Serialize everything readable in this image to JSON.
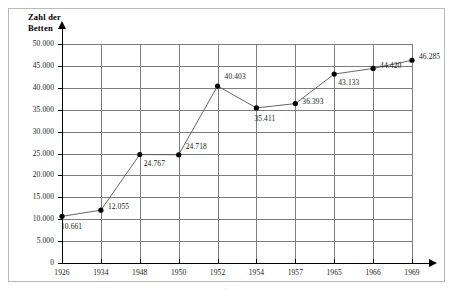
{
  "chart_data": {
    "type": "line",
    "title": "",
    "ylabel": "Zahl der\nBetten",
    "ylabel_line1": "Zahl der",
    "ylabel_line2": "Betten",
    "xlabel": "",
    "categories": [
      "1926",
      "1934",
      "1948",
      "1950",
      "1952",
      "1954",
      "1957",
      "1965",
      "1966",
      "1969"
    ],
    "values": [
      10661,
      12055,
      24767,
      24718,
      40403,
      35411,
      36393,
      43133,
      44420,
      46285
    ],
    "point_labels": [
      "10.661",
      "12.055",
      "24.767",
      "24.718",
      "40.403",
      "35.411",
      "36.393",
      "43.133",
      "44.420",
      "46.285"
    ],
    "ylim": [
      0,
      50000
    ],
    "y_ticks": [
      0,
      5000,
      10000,
      15000,
      20000,
      25000,
      30000,
      35000,
      40000,
      45000,
      50000
    ],
    "y_tick_labels": [
      "0",
      "5.000",
      "10.000",
      "15.000",
      "20.000",
      "25.000",
      "30.000",
      "35.000",
      "40.000",
      "45.000",
      "50.000"
    ],
    "grid": true,
    "legend": "none",
    "series_color": "#555555",
    "marker_color": "#000000",
    "grid_color": "#7d7d7d",
    "axis_color": "#000000"
  },
  "footer": {
    "mark": "."
  }
}
